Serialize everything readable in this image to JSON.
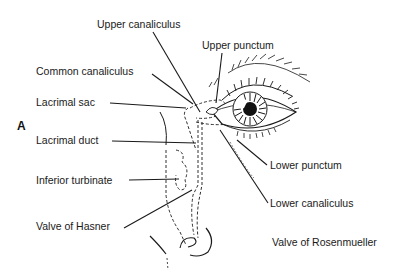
{
  "figure": {
    "panel_letter": "A",
    "labels": {
      "upper_canaliculus": "Upper canaliculus",
      "upper_punctum": "Upper punctum",
      "common_canaliculus": "Common canaliculus",
      "lacrimal_sac": "Lacrimal sac",
      "lacrimal_duct": "Lacrimal duct",
      "inferior_turbinate": "Inferior turbinate",
      "valve_of_hasner": "Valve of Hasner",
      "lower_punctum": "Lower punctum",
      "lower_canaliculus": "Lower canaliculus",
      "valve_of_rosenmueller": "Valve of Rosenmueller"
    },
    "colors": {
      "line": "#1a1a1a",
      "background": "#ffffff"
    }
  }
}
